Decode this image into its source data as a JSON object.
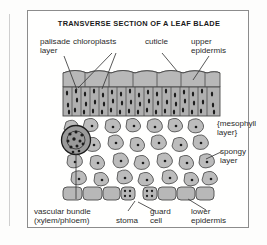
{
  "figure": {
    "title": "TRANSVERSE SECTION OF A LEAF BLADE",
    "type": "biological-cross-section-diagram",
    "subject": "leaf blade"
  },
  "labels": {
    "palisade_layer": "palisade\nlayer",
    "chloroplasts": "chloroplasts",
    "cuticle": "cuticle",
    "upper_epidermis": "upper\nepidermis",
    "mesophyll_layer": "{mesophyll\nlayer}",
    "spongy_layer": "spongy\nlayer",
    "vascular_bundle": "vascular bundle\n(xylem/phloem)",
    "stoma": "stoma",
    "guard_cell": "guard\ncell",
    "lower_epidermis": "lower\nepidermis"
  },
  "colors": {
    "cell_fill": "#b8b8b8",
    "cell_stroke": "#4a4a4a",
    "organelle": "#1c1c1c",
    "frame": "#8c8c8c",
    "text": "#2b2b2b",
    "background": "#fffffe"
  },
  "structures": {
    "cuticle": "wavy outer line above upper epidermis",
    "upper_epidermis": "single row of rounded rectangular cells",
    "palisade_layer": "column of tall vertical cells packed with chloroplasts",
    "spongy_layer": "loose irregular rounded cells with air spaces, each with nucleus",
    "vascular_bundle": "dark circular bundle of xylem and phloem within mesophyll",
    "lower_epidermis": "single row of cells interrupted by a stoma",
    "stoma": "pore gap between two guard cells",
    "guard_cell": "speckled cell flanking the stomatal pore"
  }
}
